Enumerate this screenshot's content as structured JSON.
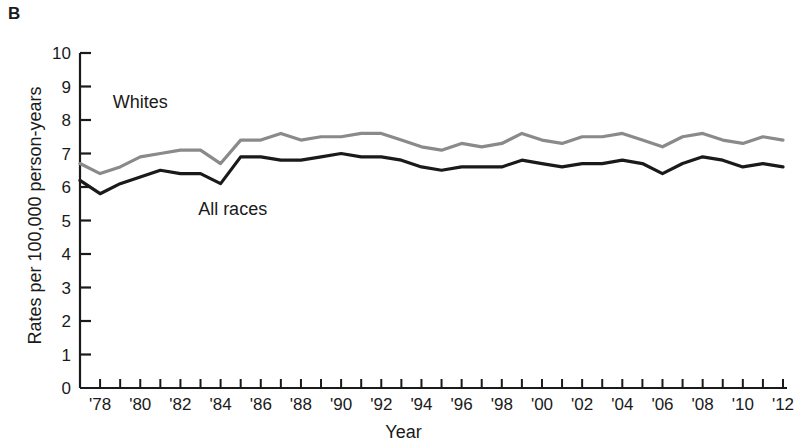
{
  "panel": {
    "label": "B"
  },
  "chart_data": {
    "type": "line",
    "title": "",
    "xlabel": "Year",
    "ylabel": "Rates per 100,000 person-years",
    "xlim": [
      1977,
      2012
    ],
    "ylim": [
      0,
      10
    ],
    "grid": false,
    "legend_position": "inline-annotation",
    "ytick_labels": [
      "0",
      "1",
      "2",
      "3",
      "4",
      "5",
      "6",
      "7",
      "8",
      "9",
      "10"
    ],
    "ytick_values": [
      0,
      1,
      2,
      3,
      4,
      5,
      6,
      7,
      8,
      9,
      10
    ],
    "xtick_values": [
      1977,
      1978,
      1979,
      1980,
      1981,
      1982,
      1983,
      1984,
      1985,
      1986,
      1987,
      1988,
      1989,
      1990,
      1991,
      1992,
      1993,
      1994,
      1995,
      1996,
      1997,
      1998,
      1999,
      2000,
      2001,
      2002,
      2003,
      2004,
      2005,
      2006,
      2007,
      2008,
      2009,
      2010,
      2011,
      2012
    ],
    "xtick_labels": [
      "'78",
      "'80",
      "'82",
      "'84",
      "'86",
      "'88",
      "'90",
      "'92",
      "'94",
      "'96",
      "'98",
      "'00",
      "'02",
      "'04",
      "'06",
      "'08",
      "'10",
      "'12"
    ],
    "xtick_label_values": [
      1978,
      1980,
      1982,
      1984,
      1986,
      1988,
      1990,
      1992,
      1994,
      1996,
      1998,
      2000,
      2002,
      2004,
      2006,
      2008,
      2010,
      2012
    ],
    "x": [
      1977,
      1978,
      1979,
      1980,
      1981,
      1982,
      1983,
      1984,
      1985,
      1986,
      1987,
      1988,
      1989,
      1990,
      1991,
      1992,
      1993,
      1994,
      1995,
      1996,
      1997,
      1998,
      1999,
      2000,
      2001,
      2002,
      2003,
      2004,
      2005,
      2006,
      2007,
      2008,
      2009,
      2010,
      2011,
      2012
    ],
    "series": [
      {
        "name": "Whites",
        "color": "#8a8a8a",
        "label_x": 1980.0,
        "label_y": 8.35,
        "values": [
          6.7,
          6.4,
          6.6,
          6.9,
          7.0,
          7.1,
          7.1,
          6.7,
          7.4,
          7.4,
          7.6,
          7.4,
          7.5,
          7.5,
          7.6,
          7.6,
          7.4,
          7.2,
          7.1,
          7.3,
          7.2,
          7.3,
          7.6,
          7.4,
          7.3,
          7.5,
          7.5,
          7.6,
          7.4,
          7.2,
          7.5,
          7.6,
          7.4,
          7.3,
          7.5,
          7.4
        ]
      },
      {
        "name": "All races",
        "color": "#1a1a1a",
        "label_x": 1984.6,
        "label_y": 5.15,
        "values": [
          6.2,
          5.8,
          6.1,
          6.3,
          6.5,
          6.4,
          6.4,
          6.1,
          6.9,
          6.9,
          6.8,
          6.8,
          6.9,
          7.0,
          6.9,
          6.9,
          6.8,
          6.6,
          6.5,
          6.6,
          6.6,
          6.6,
          6.8,
          6.7,
          6.6,
          6.7,
          6.7,
          6.8,
          6.7,
          6.4,
          6.7,
          6.9,
          6.8,
          6.6,
          6.7,
          6.6
        ]
      }
    ]
  }
}
